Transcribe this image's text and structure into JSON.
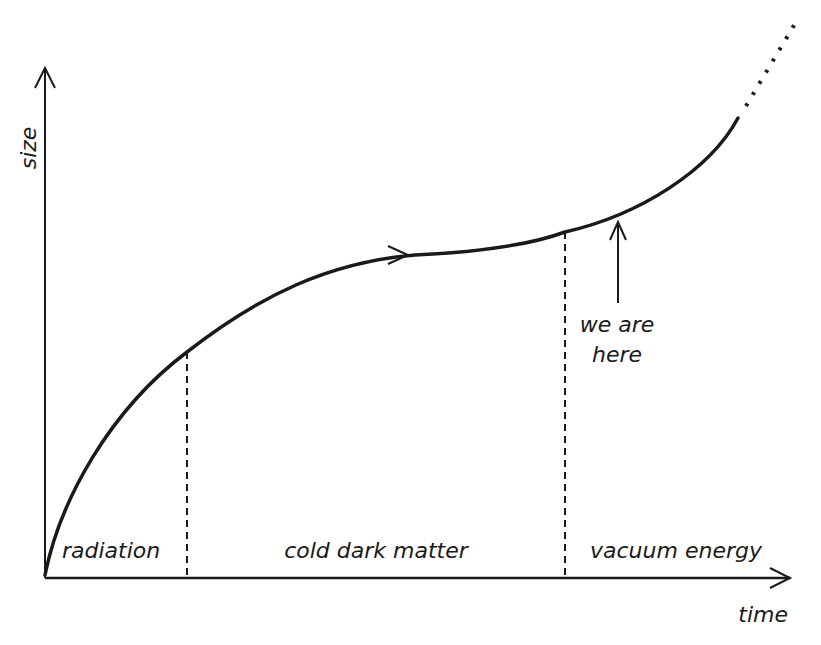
{
  "axes": {
    "y_label": "size",
    "x_label": "time"
  },
  "eras": [
    {
      "label": "radiation"
    },
    {
      "label": "cold dark matter"
    },
    {
      "label": "vacuum energy"
    }
  ],
  "annotation": {
    "line1": "we are",
    "line2": "here"
  },
  "colors": {
    "ink": "#1a1a1a",
    "background": "#ffffff"
  }
}
